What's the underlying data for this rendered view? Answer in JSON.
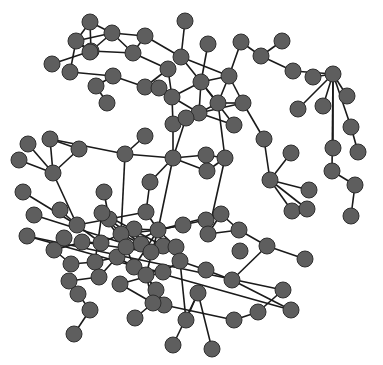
{
  "diagram": {
    "type": "network-graph",
    "style": {
      "node_fill": "#5e5e5e",
      "node_stroke": "#2e2e2e",
      "edge_color": "#1a1a1a",
      "background": "#ffffff",
      "node_radius": 8
    },
    "nodes": [
      [
        90,
        22
      ],
      [
        112,
        33
      ],
      [
        76,
        41
      ],
      [
        91,
        51
      ],
      [
        145,
        36
      ],
      [
        133,
        53
      ],
      [
        52,
        64
      ],
      [
        70,
        72
      ],
      [
        90,
        52
      ],
      [
        185,
        21
      ],
      [
        181,
        57
      ],
      [
        208,
        44
      ],
      [
        241,
        42
      ],
      [
        282,
        41
      ],
      [
        261,
        56
      ],
      [
        293,
        71
      ],
      [
        313,
        77
      ],
      [
        333,
        74
      ],
      [
        347,
        96
      ],
      [
        323,
        106
      ],
      [
        298,
        109
      ],
      [
        351,
        127
      ],
      [
        333,
        148
      ],
      [
        332,
        171
      ],
      [
        358,
        152
      ],
      [
        355,
        185
      ],
      [
        351,
        216
      ],
      [
        201,
        82
      ],
      [
        229,
        76
      ],
      [
        172,
        97
      ],
      [
        199,
        113
      ],
      [
        218,
        103
      ],
      [
        243,
        103
      ],
      [
        234,
        125
      ],
      [
        168,
        69
      ],
      [
        145,
        87
      ],
      [
        159,
        88
      ],
      [
        113,
        76
      ],
      [
        96,
        86
      ],
      [
        107,
        103
      ],
      [
        173,
        124
      ],
      [
        186,
        118
      ],
      [
        264,
        139
      ],
      [
        270,
        180
      ],
      [
        291,
        153
      ],
      [
        309,
        190
      ],
      [
        292,
        211
      ],
      [
        307,
        209
      ],
      [
        19,
        160
      ],
      [
        28,
        144
      ],
      [
        50,
        139
      ],
      [
        79,
        149
      ],
      [
        53,
        173
      ],
      [
        125,
        154
      ],
      [
        145,
        136
      ],
      [
        173,
        158
      ],
      [
        206,
        155
      ],
      [
        225,
        158
      ],
      [
        207,
        171
      ],
      [
        150,
        182
      ],
      [
        23,
        192
      ],
      [
        34,
        215
      ],
      [
        60,
        210
      ],
      [
        77,
        225
      ],
      [
        104,
        192
      ],
      [
        109,
        219
      ],
      [
        146,
        212
      ],
      [
        134,
        229
      ],
      [
        158,
        230
      ],
      [
        183,
        225
      ],
      [
        206,
        220
      ],
      [
        221,
        214
      ],
      [
        208,
        234
      ],
      [
        239,
        230
      ],
      [
        267,
        246
      ],
      [
        305,
        259
      ],
      [
        101,
        243
      ],
      [
        121,
        234
      ],
      [
        141,
        244
      ],
      [
        163,
        246
      ],
      [
        176,
        247
      ],
      [
        82,
        242
      ],
      [
        54,
        250
      ],
      [
        71,
        264
      ],
      [
        95,
        262
      ],
      [
        117,
        257
      ],
      [
        134,
        267
      ],
      [
        146,
        275
      ],
      [
        163,
        272
      ],
      [
        180,
        261
      ],
      [
        206,
        270
      ],
      [
        232,
        280
      ],
      [
        240,
        251
      ],
      [
        69,
        281
      ],
      [
        78,
        294
      ],
      [
        90,
        310
      ],
      [
        74,
        334
      ],
      [
        99,
        277
      ],
      [
        120,
        284
      ],
      [
        156,
        290
      ],
      [
        164,
        305
      ],
      [
        135,
        318
      ],
      [
        153,
        303
      ],
      [
        186,
        320
      ],
      [
        198,
        293
      ],
      [
        212,
        349
      ],
      [
        173,
        345
      ],
      [
        234,
        320
      ],
      [
        258,
        312
      ],
      [
        283,
        290
      ],
      [
        291,
        310
      ],
      [
        27,
        236
      ],
      [
        64,
        238
      ],
      [
        151,
        252
      ],
      [
        126,
        247
      ],
      [
        102,
        213
      ]
    ],
    "edges": [
      [
        0,
        1
      ],
      [
        0,
        3
      ],
      [
        0,
        2
      ],
      [
        1,
        2
      ],
      [
        1,
        3
      ],
      [
        1,
        4
      ],
      [
        1,
        5
      ],
      [
        2,
        3
      ],
      [
        2,
        8
      ],
      [
        3,
        8
      ],
      [
        3,
        5
      ],
      [
        3,
        6
      ],
      [
        2,
        7
      ],
      [
        7,
        37
      ],
      [
        37,
        38
      ],
      [
        37,
        35
      ],
      [
        38,
        39
      ],
      [
        4,
        5
      ],
      [
        5,
        34
      ],
      [
        4,
        10
      ],
      [
        9,
        10
      ],
      [
        10,
        28
      ],
      [
        10,
        27
      ],
      [
        11,
        27
      ],
      [
        27,
        28
      ],
      [
        28,
        12
      ],
      [
        12,
        14
      ],
      [
        13,
        14
      ],
      [
        14,
        15
      ],
      [
        15,
        17
      ],
      [
        16,
        17
      ],
      [
        17,
        18
      ],
      [
        17,
        19
      ],
      [
        17,
        20
      ],
      [
        17,
        21
      ],
      [
        17,
        22
      ],
      [
        17,
        23
      ],
      [
        21,
        24
      ],
      [
        23,
        25
      ],
      [
        25,
        26
      ],
      [
        27,
        29
      ],
      [
        27,
        30
      ],
      [
        27,
        31
      ],
      [
        27,
        33
      ],
      [
        28,
        31
      ],
      [
        28,
        32
      ],
      [
        29,
        30
      ],
      [
        30,
        31
      ],
      [
        30,
        32
      ],
      [
        30,
        33
      ],
      [
        30,
        41
      ],
      [
        31,
        32
      ],
      [
        34,
        29
      ],
      [
        34,
        35
      ],
      [
        35,
        36
      ],
      [
        36,
        29
      ],
      [
        29,
        40
      ],
      [
        40,
        41
      ],
      [
        40,
        55
      ],
      [
        41,
        55
      ],
      [
        31,
        57
      ],
      [
        32,
        42
      ],
      [
        42,
        43
      ],
      [
        43,
        44
      ],
      [
        43,
        45
      ],
      [
        43,
        46
      ],
      [
        43,
        47
      ],
      [
        46,
        47
      ],
      [
        55,
        56
      ],
      [
        55,
        58
      ],
      [
        56,
        57
      ],
      [
        57,
        58
      ],
      [
        57,
        72
      ],
      [
        55,
        53
      ],
      [
        53,
        50
      ],
      [
        53,
        54
      ],
      [
        53,
        77
      ],
      [
        55,
        59
      ],
      [
        59,
        66
      ],
      [
        55,
        68
      ],
      [
        48,
        52
      ],
      [
        49,
        52
      ],
      [
        50,
        52
      ],
      [
        51,
        52
      ],
      [
        50,
        51
      ],
      [
        52,
        63
      ],
      [
        60,
        63
      ],
      [
        62,
        63
      ],
      [
        63,
        65
      ],
      [
        63,
        76
      ],
      [
        64,
        65
      ],
      [
        65,
        66
      ],
      [
        65,
        78
      ],
      [
        66,
        68
      ],
      [
        67,
        68
      ],
      [
        67,
        78
      ],
      [
        68,
        69
      ],
      [
        68,
        70
      ],
      [
        68,
        71
      ],
      [
        68,
        79
      ],
      [
        68,
        80
      ],
      [
        68,
        77
      ],
      [
        68,
        87
      ],
      [
        68,
        86
      ],
      [
        68,
        114
      ],
      [
        70,
        71
      ],
      [
        71,
        72
      ],
      [
        71,
        73
      ],
      [
        72,
        73
      ],
      [
        73,
        74
      ],
      [
        74,
        75
      ],
      [
        74,
        91
      ],
      [
        91,
        110
      ],
      [
        110,
        111
      ],
      [
        109,
        111
      ],
      [
        108,
        109
      ],
      [
        107,
        108
      ],
      [
        90,
        91
      ],
      [
        89,
        90
      ],
      [
        89,
        80
      ],
      [
        80,
        79
      ],
      [
        79,
        78
      ],
      [
        78,
        77
      ],
      [
        77,
        76
      ],
      [
        76,
        81
      ],
      [
        81,
        82
      ],
      [
        82,
        112
      ],
      [
        83,
        82
      ],
      [
        83,
        84
      ],
      [
        84,
        85
      ],
      [
        85,
        86
      ],
      [
        85,
        97
      ],
      [
        86,
        87
      ],
      [
        86,
        88
      ],
      [
        87,
        99
      ],
      [
        87,
        100
      ],
      [
        88,
        89
      ],
      [
        88,
        98
      ],
      [
        89,
        103
      ],
      [
        87,
        102
      ],
      [
        102,
        101
      ],
      [
        99,
        100
      ],
      [
        100,
        107
      ],
      [
        103,
        104
      ],
      [
        104,
        105
      ],
      [
        104,
        106
      ],
      [
        97,
        93
      ],
      [
        93,
        94
      ],
      [
        94,
        95
      ],
      [
        95,
        96
      ],
      [
        98,
        102
      ],
      [
        61,
        113
      ],
      [
        113,
        116
      ],
      [
        116,
        79
      ],
      [
        116,
        78
      ],
      [
        114,
        115
      ],
      [
        114,
        78
      ],
      [
        115,
        77
      ],
      [
        115,
        79
      ],
      [
        81,
        113
      ],
      [
        62,
        116
      ],
      [
        84,
        115
      ],
      [
        86,
        114
      ]
    ]
  }
}
